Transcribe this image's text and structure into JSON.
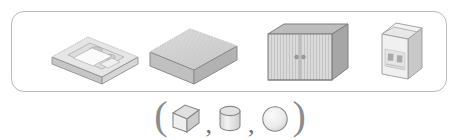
{
  "panel": {
    "name": "object-reference-panel",
    "border_color": "#b9b9b9",
    "background": "#ffffff",
    "objects": [
      {
        "id": "object-1",
        "label": "flat-rectangular-case",
        "description": "flat rectangular cassette-like case in isometric view",
        "primitive": "cuboid",
        "fill": "#e3e3e3",
        "top_fill": "#ececec",
        "side_fill": "#cfcfcf",
        "stroke": "#9a9a9a"
      },
      {
        "id": "object-2",
        "label": "rectangular-box",
        "description": "shallow rectangular box with hatched top face",
        "primitive": "cuboid",
        "fill": "#dcdcdc",
        "top_fill": "#d2d2d2",
        "side_fill": "#bdbdbd",
        "stroke": "#8f8f8f"
      },
      {
        "id": "object-3",
        "label": "two-door-cabinet",
        "description": "cabinet with two slatted doors and two round knobs",
        "primitive": "cuboid",
        "fill": "#d9d9d9",
        "top_fill": "#b8b8b8",
        "side_fill": "#a7a7a7",
        "stroke": "#7e7e7e"
      },
      {
        "id": "object-4",
        "label": "carton-package",
        "description": "upright carton package with printed label panel",
        "primitive": "cuboid",
        "fill": "#eeeeee",
        "top_fill": "#f4f4f4",
        "side_fill": "#c9c9c9",
        "stroke": "#9a9a9a"
      }
    ]
  },
  "legend": {
    "name": "primitive-shape-tuple",
    "open_paren": "(",
    "close_paren": ")",
    "separator": ",",
    "shapes": [
      {
        "id": "shape-cube",
        "label": "cube",
        "fill": "#ebebeb",
        "top_fill": "#e0e0e0",
        "side_fill": "#cccccc",
        "stroke": "#8a8a8a"
      },
      {
        "id": "shape-cylinder",
        "label": "cylinder",
        "fill": "#e6e6e6",
        "top_fill": "#d7d7d7",
        "stroke": "#8a8a8a"
      },
      {
        "id": "shape-sphere",
        "label": "sphere",
        "fill": "#ededed",
        "stroke": "#8a8a8a"
      }
    ]
  }
}
